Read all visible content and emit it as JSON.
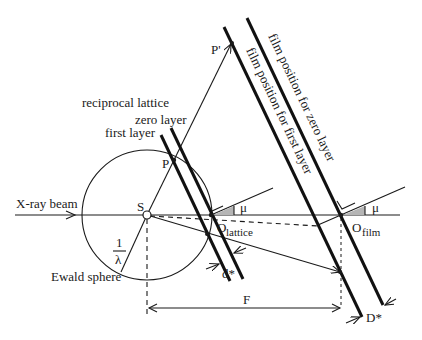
{
  "diagram": {
    "labels": {
      "xray_beam": "X-ray beam",
      "source": "S",
      "point_p": "P",
      "point_p_prime": "P'",
      "reciprocal_lattice": "reciprocal lattice",
      "zero_layer": "zero layer",
      "first_layer": "first layer",
      "ewald_sphere": "Ewald sphere",
      "one_over_lambda_num": "1",
      "one_over_lambda_den": "λ",
      "o_lattice_main": "O",
      "o_lattice_sub": "lattice",
      "o_film_main": "O",
      "o_film_sub": "film",
      "mu_lattice": "μ",
      "mu_film": "μ",
      "d_star": "d*",
      "D_star": "D*",
      "F": "F",
      "film_zero": "film position for zero layer",
      "film_first": "film position for first layer"
    },
    "colors": {
      "line": "#1a1a1a",
      "wedge": "#b5b5b5",
      "background": "#ffffff"
    }
  }
}
